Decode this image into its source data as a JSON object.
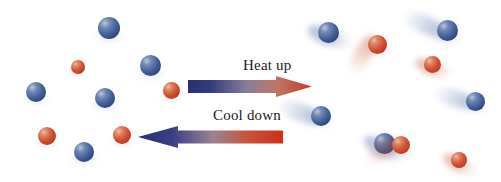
{
  "figure": {
    "background_color": "#ffffff",
    "width": 501,
    "height": 182
  },
  "colors": {
    "particle_blue": "#44619c",
    "particle_red": "#cf5130",
    "arrow_cold": "#2e3580",
    "arrow_hot": "#c0392b",
    "label_text": "#1a1a1a"
  },
  "arrows": [
    {
      "id": "heat-up",
      "label": "Heat up",
      "direction": "right",
      "gradient_from": "#2e3580",
      "gradient_to": "#c0392b",
      "x": 188,
      "y": 76,
      "width": 124,
      "height": 21,
      "label_x": 243,
      "label_y": 57
    },
    {
      "id": "cool-down",
      "label": "Cool down",
      "direction": "left",
      "gradient_from": "#c0392b",
      "gradient_to": "#2e3580",
      "x": 138,
      "y": 126,
      "width": 145,
      "height": 22,
      "label_x": 213,
      "label_y": 107
    }
  ],
  "left_region": {
    "state": "cold",
    "description": "Slow-moving particles shown as crisp spheres without motion blur",
    "particles": [
      {
        "color": "blue",
        "x": 98,
        "y": 17,
        "size": 22,
        "blur": 0
      },
      {
        "color": "blue",
        "x": 140,
        "y": 55,
        "size": 21,
        "blur": 0
      },
      {
        "color": "red",
        "x": 71,
        "y": 60,
        "size": 14,
        "blur": 0
      },
      {
        "color": "blue",
        "x": 26,
        "y": 82,
        "size": 20,
        "blur": 0
      },
      {
        "color": "blue",
        "x": 95,
        "y": 88,
        "size": 20,
        "blur": 0
      },
      {
        "color": "red",
        "x": 163,
        "y": 82,
        "size": 17,
        "blur": 0
      },
      {
        "color": "red",
        "x": 38,
        "y": 127,
        "size": 18,
        "blur": 0
      },
      {
        "color": "red",
        "x": 113,
        "y": 126,
        "size": 18,
        "blur": 0
      },
      {
        "color": "blue",
        "x": 74,
        "y": 142,
        "size": 20,
        "blur": 0
      }
    ]
  },
  "right_region": {
    "state": "hot",
    "description": "Fast-moving particles shown with motion blur trails indicating high kinetic energy",
    "particles": [
      {
        "color": "blue",
        "x": 318,
        "y": 22,
        "size": 21,
        "trail": true,
        "trail_angle": 200
      },
      {
        "color": "red",
        "x": 368,
        "y": 35,
        "size": 19,
        "trail": true,
        "trail_angle": 300
      },
      {
        "color": "blue",
        "x": 437,
        "y": 20,
        "size": 21,
        "trail": true,
        "trail_angle": 25
      },
      {
        "color": "red",
        "x": 424,
        "y": 56,
        "size": 17,
        "trail": true,
        "trail_angle": 200
      },
      {
        "color": "blue",
        "x": 311,
        "y": 106,
        "size": 20,
        "trail": true,
        "trail_angle": 20
      },
      {
        "color": "blue",
        "x": 466,
        "y": 92,
        "size": 19,
        "trail": true,
        "trail_angle": 15
      },
      {
        "color": "blue",
        "x": 374,
        "y": 133,
        "size": 21,
        "trail": true,
        "trail_angle": 205
      },
      {
        "color": "red",
        "x": 392,
        "y": 136,
        "size": 18,
        "trail": true,
        "trail_angle": 330
      },
      {
        "color": "red",
        "x": 451,
        "y": 152,
        "size": 16,
        "trail": true,
        "trail_angle": 210
      }
    ]
  }
}
